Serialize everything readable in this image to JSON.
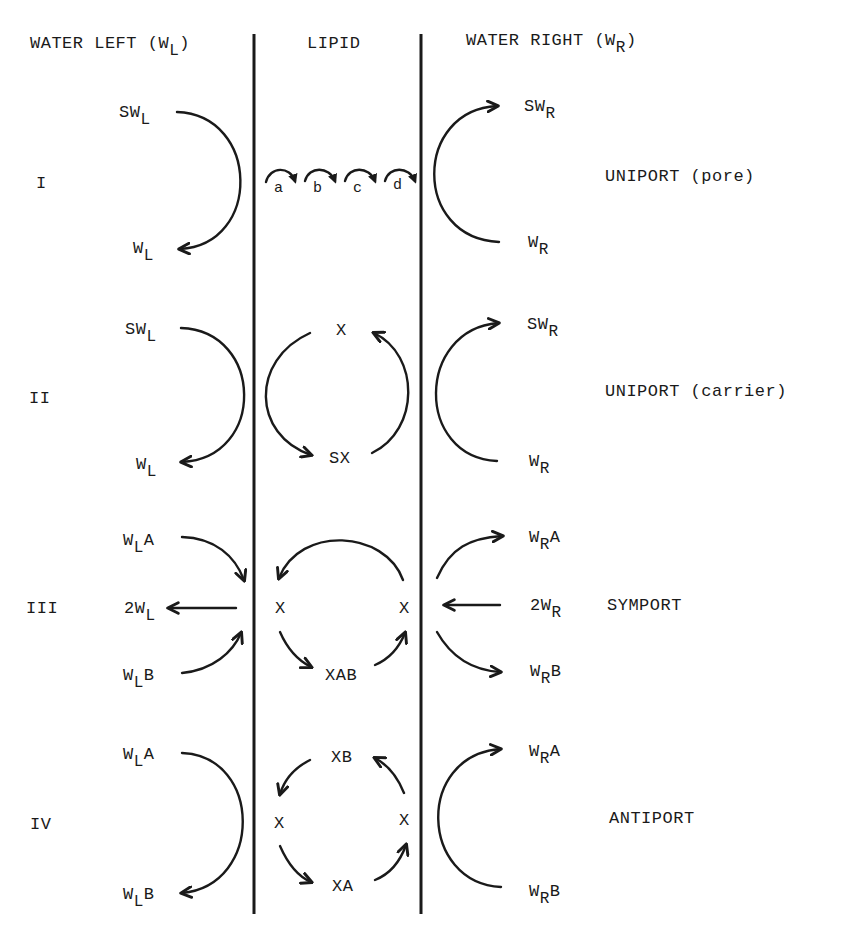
{
  "headers": {
    "water_left": {
      "text": "WATER LEFT (W",
      "sub": "L",
      "close": ")"
    },
    "lipid": "LIPID",
    "water_right": {
      "text": "WATER RIGHT (W",
      "sub": "R",
      "close": ")"
    }
  },
  "rows": [
    {
      "numeral": "I",
      "type": "UNIPORT  (pore)",
      "left_top": {
        "main": "SW",
        "sub": "L",
        "sup": ""
      },
      "left_bottom": {
        "main": "W",
        "sub": "L",
        "sup": ""
      },
      "right_top": {
        "main": "SW",
        "sub": "R",
        "sup": ""
      },
      "right_bottom": {
        "main": "W",
        "sub": "R",
        "sup": ""
      },
      "steps": [
        "a",
        "b",
        "c",
        "d"
      ]
    },
    {
      "numeral": "II",
      "type": "UNIPORT  (carrier)",
      "left_top": {
        "main": "SW",
        "sub": "L",
        "sup": ""
      },
      "left_bottom": {
        "main": "W",
        "sub": "L",
        "sup": ""
      },
      "right_top": {
        "main": "SW",
        "sub": "R",
        "sup": ""
      },
      "right_bottom": {
        "main": "W",
        "sub": "R",
        "sup": ""
      },
      "lipid_top": "X",
      "lipid_bottom": "SX"
    },
    {
      "numeral": "III",
      "type": "SYMPORT",
      "left_top": {
        "main": "W",
        "sub": "L",
        "sup": "A"
      },
      "left_mid": {
        "main": "2W",
        "sub": "L",
        "sup": ""
      },
      "left_bottom": {
        "main": "W",
        "sub": "L",
        "sup": "B"
      },
      "right_top": {
        "main": "W",
        "sub": "R",
        "sup": "A"
      },
      "right_mid": {
        "main": "2W",
        "sub": "R",
        "sup": ""
      },
      "right_bottom": {
        "main": "W",
        "sub": "R",
        "sup": "B"
      },
      "lipid_left": "X",
      "lipid_right": "X",
      "lipid_bottom": "XAB"
    },
    {
      "numeral": "IV",
      "type": "ANTIPORT",
      "left_top": {
        "main": "W",
        "sub": "L",
        "sup": "A"
      },
      "left_bottom": {
        "main": "W",
        "sub": "L",
        "sup": "B"
      },
      "right_top": {
        "main": "W",
        "sub": "R",
        "sup": "A"
      },
      "right_bottom": {
        "main": "W",
        "sub": "R",
        "sup": "B"
      },
      "lipid_top": "XB",
      "lipid_left": "X",
      "lipid_right": "X",
      "lipid_bottom": "XA"
    }
  ]
}
